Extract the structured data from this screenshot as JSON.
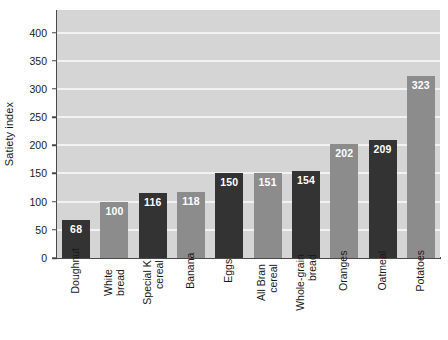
{
  "chart_data": {
    "type": "bar",
    "title": "",
    "xlabel": "",
    "ylabel": "Satiety index",
    "ylim": [
      0,
      440
    ],
    "yticks": [
      0,
      50,
      100,
      150,
      200,
      250,
      300,
      350,
      400
    ],
    "grid": true,
    "legend": "none",
    "categories": [
      "Doughnut",
      "White bread",
      "Special K cereal",
      "Banana",
      "Eggs",
      "All Bran cereal",
      "Whole-grain bread",
      "Oranges",
      "Oatmeal",
      "Potatoes"
    ],
    "category_lines": [
      [
        "Doughnut"
      ],
      [
        "White",
        "bread"
      ],
      [
        "Special K",
        "cereal"
      ],
      [
        "Banana"
      ],
      [
        "Eggs"
      ],
      [
        "All Bran",
        "cereal"
      ],
      [
        "Whole-grain",
        "bread"
      ],
      [
        "Oranges"
      ],
      [
        "Oatmeal"
      ],
      [
        "Potatoes"
      ]
    ],
    "values": [
      68,
      100,
      116,
      118,
      150,
      151,
      154,
      202,
      209,
      323
    ],
    "bar_colors": [
      "#333333",
      "#8c8c8c",
      "#333333",
      "#8c8c8c",
      "#333333",
      "#8c8c8c",
      "#333333",
      "#8c8c8c",
      "#333333",
      "#8c8c8c"
    ],
    "value_label_color": "#ffffff",
    "plot_background": "#d5d5d5",
    "gridline_color": "#f2f2f2",
    "axis_color": "#4a4a4a",
    "page_background": "#ffffff"
  }
}
